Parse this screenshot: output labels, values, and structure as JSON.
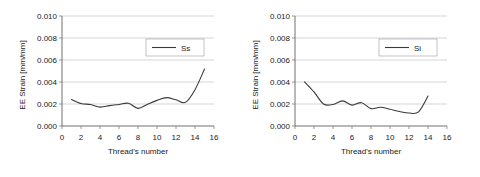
{
  "chart_data": [
    {
      "type": "line",
      "title": "",
      "xlabel": "Thread's number",
      "ylabel": "EE Strain [mm/mm]",
      "xlim": [
        0,
        16
      ],
      "ylim": [
        0.0,
        0.01
      ],
      "xticks": [
        0,
        2,
        4,
        6,
        8,
        10,
        12,
        14,
        16
      ],
      "xtick_labels": [
        "0",
        "2",
        "4",
        "6",
        "8",
        "10",
        "12",
        "14",
        "16"
      ],
      "yticks": [
        0.0,
        0.002,
        0.004,
        0.006,
        0.008,
        0.01
      ],
      "ytick_labels": [
        "0.000",
        "0.002",
        "0.004",
        "0.006",
        "0.008",
        "0.010"
      ],
      "grid": "horizontal",
      "legend_position": "upper-right",
      "series": [
        {
          "name": "Ss",
          "x": [
            1,
            2,
            3,
            4,
            5,
            6,
            7,
            8,
            9,
            10,
            11,
            12,
            13,
            14,
            15
          ],
          "values": [
            0.0024,
            0.00205,
            0.00195,
            0.00172,
            0.00185,
            0.00196,
            0.00207,
            0.0016,
            0.00198,
            0.00233,
            0.00258,
            0.00238,
            0.00215,
            0.0033,
            0.00518
          ]
        }
      ]
    },
    {
      "type": "line",
      "title": "",
      "xlabel": "Thread's number",
      "ylabel": "EE Strain [mm/mm]",
      "xlim": [
        0,
        16
      ],
      "ylim": [
        0.0,
        0.01
      ],
      "xticks": [
        0,
        2,
        4,
        6,
        8,
        10,
        12,
        14,
        16
      ],
      "xtick_labels": [
        "0",
        "2",
        "4",
        "6",
        "8",
        "10",
        "12",
        "14",
        "16"
      ],
      "yticks": [
        0.0,
        0.002,
        0.004,
        0.006,
        0.008,
        0.01
      ],
      "ytick_labels": [
        "0.000",
        "0.002",
        "0.004",
        "0.006",
        "0.008",
        "0.010"
      ],
      "grid": "horizontal",
      "legend_position": "upper-right",
      "series": [
        {
          "name": "Si",
          "x": [
            1,
            2,
            3,
            4,
            5,
            6,
            7,
            8,
            9,
            10,
            11,
            12,
            13,
            14
          ],
          "values": [
            0.00402,
            0.0031,
            0.002,
            0.00196,
            0.00228,
            0.0019,
            0.00212,
            0.00158,
            0.0017,
            0.00152,
            0.00132,
            0.00118,
            0.00128,
            0.00272
          ]
        }
      ]
    }
  ],
  "panels": [
    {
      "id": "panel-left",
      "ylabel": "EE Strain [mm/mm]",
      "xlabel": "Thread's number",
      "legend": {
        "label": "Ss"
      },
      "ytick_labels": [
        "0.010",
        "0.008",
        "0.006",
        "0.004",
        "0.002",
        "0.000"
      ],
      "xtick_labels": [
        "0",
        "2",
        "4",
        "6",
        "8",
        "10",
        "12",
        "14",
        "16"
      ]
    },
    {
      "id": "panel-right",
      "ylabel": "EE Strain [mm/mm]",
      "xlabel": "Thread's number",
      "legend": {
        "label": "Si"
      },
      "ytick_labels": [
        "0.010",
        "0.008",
        "0.006",
        "0.004",
        "0.002",
        "0.000"
      ],
      "xtick_labels": [
        "0",
        "2",
        "4",
        "6",
        "8",
        "10",
        "12",
        "14",
        "16"
      ]
    }
  ],
  "colors": {
    "line": "#3a3a3a",
    "grid": "#b9b9b9",
    "axis": "#4d4d4d",
    "text": "#1a1a1a",
    "background": "#ffffff"
  }
}
